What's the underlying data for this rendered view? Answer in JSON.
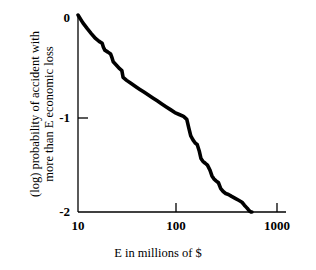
{
  "figure": {
    "background_color": "#ffffff",
    "ink_color": "#000000"
  },
  "chart_data": {
    "type": "line",
    "title": "",
    "subtitle": "",
    "xlabel": "E in millions of $",
    "ylabel_line1": "(log) probability of accident with",
    "ylabel_line2": "more than E economic loss",
    "ylabel": "(log) probability of accident with more than E economic loss",
    "xscale": "log",
    "yscale": "linear",
    "xlim": [
      10,
      1000
    ],
    "ylim": [
      -2,
      0
    ],
    "grid": false,
    "legend": null,
    "xticks": [
      10,
      100,
      1000
    ],
    "xtick_labels": [
      "10",
      "100",
      "1000"
    ],
    "yticks": [
      0,
      -1,
      -2
    ],
    "ytick_labels": [
      "0",
      "-1",
      "-2"
    ],
    "series": [
      {
        "name": "exceedance probability",
        "line_color": "#000000",
        "line_width": 3.6,
        "x": [
          10.0,
          11.2,
          12.4,
          13.6,
          15.0,
          16.3,
          17.5,
          18.0,
          18.6,
          20.0,
          21.3,
          22.0,
          22.6,
          24.6,
          26.2,
          27.6,
          28.4,
          30.8,
          34.0,
          37.5,
          41.5,
          46.0,
          51.0,
          56.5,
          62.5,
          69.0,
          76.5,
          85.0,
          94.0,
          104.0,
          115.0,
          124.0,
          130.0,
          136.0,
          143.0,
          150.0,
          158.0,
          166.0,
          172.0,
          180.0,
          190.0,
          200.0,
          212.0,
          222.0,
          232.0,
          244.0,
          258.0,
          272.0,
          288.0,
          305.0,
          325.0,
          350.0,
          380.0,
          412.0,
          445.0,
          470.0,
          490.0,
          510.0,
          530.0,
          548.0,
          560.0
        ],
        "y": [
          0.02,
          -0.06,
          -0.12,
          -0.17,
          -0.22,
          -0.25,
          -0.27,
          -0.31,
          -0.34,
          -0.36,
          -0.38,
          -0.42,
          -0.46,
          -0.5,
          -0.53,
          -0.55,
          -0.62,
          -0.65,
          -0.68,
          -0.71,
          -0.74,
          -0.77,
          -0.8,
          -0.83,
          -0.86,
          -0.89,
          -0.92,
          -0.95,
          -0.98,
          -1.0,
          -1.02,
          -1.05,
          -1.14,
          -1.22,
          -1.26,
          -1.29,
          -1.31,
          -1.38,
          -1.45,
          -1.48,
          -1.5,
          -1.52,
          -1.57,
          -1.63,
          -1.66,
          -1.68,
          -1.7,
          -1.76,
          -1.79,
          -1.81,
          -1.82,
          -1.84,
          -1.86,
          -1.88,
          -1.9,
          -1.93,
          -1.95,
          -1.97,
          -1.99,
          -2.0,
          -2.0
        ]
      }
    ],
    "annotations": []
  }
}
